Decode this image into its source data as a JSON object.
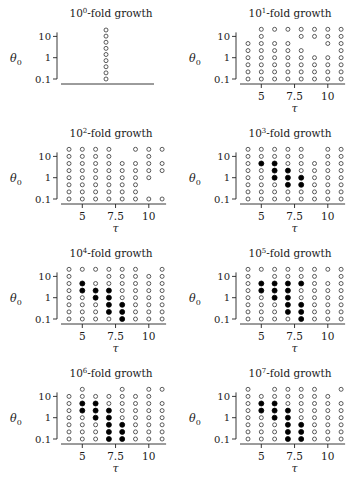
{
  "figure": {
    "y_label": "θ0",
    "x_label": "τ",
    "y_ticks": [
      "10",
      "1",
      "0.1"
    ],
    "x_ticks": [
      "5",
      "7.5",
      "10"
    ],
    "legend": {
      "open": "open circle",
      "filled": "filled circle"
    }
  },
  "chart_data": [
    {
      "type": "scatter",
      "title": "10^0-fold growth",
      "title_base": "10",
      "title_exp": "0",
      "title_suffix": "-fold growth",
      "xlabel": "",
      "ylabel": "θ0",
      "yticks": [
        10,
        1,
        0.1
      ],
      "xticks": [],
      "single_column": true,
      "points": "9 open circles in a single vertical column spanning θ0 0.1 to ~30"
    },
    {
      "type": "scatter",
      "title": "10^1-fold growth",
      "title_base": "10",
      "title_exp": "1",
      "title_suffix": "-fold growth",
      "xlabel": "τ",
      "ylabel": "θ0",
      "tau": [
        4,
        5,
        6,
        7,
        8,
        9,
        10,
        11
      ],
      "theta0": [
        21.5,
        10,
        4.64,
        2.15,
        1,
        0.464,
        0.215,
        0.1
      ],
      "xticks": [
        5,
        7.5,
        10
      ],
      "yticks": [
        10,
        1,
        0.1
      ],
      "grid": [
        ".ooooooo",
        ".o..oooo",
        "oooo..oo",
        "ooooo..o",
        "oooooooo",
        "oooooooo",
        "oooooooo",
        "oooooooo"
      ]
    },
    {
      "type": "scatter",
      "title": "10^2-fold growth",
      "title_base": "10",
      "title_exp": "2",
      "title_suffix": "-fold growth",
      "xlabel": "τ",
      "ylabel": "θ0",
      "tau": [
        4,
        5,
        6,
        7,
        8,
        9,
        10,
        11
      ],
      "theta0": [
        21.5,
        10,
        4.64,
        2.15,
        1,
        0.464,
        0.215,
        0.1
      ],
      "xticks": [
        5,
        7.5,
        10
      ],
      "yticks": [
        10,
        1,
        0.1
      ],
      "grid": [
        "oooo.ooo",
        "oooo..o.",
        "oooooooo",
        "oooooooo",
        "ooooooo.",
        "oooooo..",
        "oooooo..",
        "oooooooo"
      ]
    },
    {
      "type": "scatter",
      "title": "10^3-fold growth",
      "title_base": "10",
      "title_exp": "3",
      "title_suffix": "-fold growth",
      "xlabel": "τ",
      "ylabel": "θ0",
      "tau": [
        4,
        5,
        6,
        7,
        8,
        9,
        10,
        11
      ],
      "theta0": [
        21.5,
        10,
        4.64,
        2.15,
        1,
        0.464,
        0.215,
        0.1
      ],
      "xticks": [
        5,
        7.5,
        10
      ],
      "yticks": [
        10,
        1,
        0.1
      ],
      "grid": [
        "ooooo.oo",
        "ooooo.oo",
        "o##ooooo",
        "oo##oooo",
        "oo###ooo",
        "ooo##ooo",
        "oooooooo",
        "oooooooo"
      ]
    },
    {
      "type": "scatter",
      "title": "10^4-fold growth",
      "title_base": "10",
      "title_exp": "4",
      "title_suffix": "-fold growth",
      "xlabel": "τ",
      "ylabel": "θ0",
      "tau": [
        4,
        5,
        6,
        7,
        8,
        9,
        10,
        11
      ],
      "theta0": [
        21.5,
        10,
        4.64,
        2.15,
        1,
        0.464,
        0.215,
        0.1
      ],
      "xticks": [
        5,
        7.5,
        10
      ],
      "yticks": [
        10,
        1,
        0.1
      ],
      "grid": [
        "oooooo.o",
        "o..ooooo",
        "o#oooooo",
        "o###oooo",
        "oo##oooo",
        "ooo##ooo",
        "ooo##ooo",
        "oooo#ooo"
      ]
    },
    {
      "type": "scatter",
      "title": "10^5-fold growth",
      "title_base": "10",
      "title_exp": "5",
      "title_suffix": "-fold growth",
      "xlabel": "τ",
      "ylabel": "θ0",
      "tau": [
        4,
        5,
        6,
        7,
        8,
        9,
        10,
        11
      ],
      "theta0": [
        21.5,
        10,
        4.64,
        2.15,
        1,
        0.464,
        0.215,
        0.1
      ],
      "xticks": [
        5,
        7.5,
        10
      ],
      "yticks": [
        10,
        1,
        0.1
      ],
      "grid": [
        "oooooooo",
        "o.oooo.o",
        "o####ooo",
        "o###oooo",
        "oo##oooo",
        "ooo##ooo",
        "ooo##ooo",
        "oooo#ooo"
      ]
    },
    {
      "type": "scatter",
      "title": "10^6-fold growth",
      "title_base": "10",
      "title_exp": "6",
      "title_suffix": "-fold growth",
      "xlabel": "τ",
      "ylabel": "θ0",
      "tau": [
        4,
        5,
        6,
        7,
        8,
        9,
        10,
        11
      ],
      "theta0": [
        21.5,
        10,
        4.64,
        2.15,
        1,
        0.464,
        0.215,
        0.1
      ],
      "xticks": [
        5,
        7.5,
        10
      ],
      "yticks": [
        10,
        1,
        0.1
      ],
      "grid": [
        ".o..o.oo",
        "ooooooo.",
        "o##ooooo",
        "o###oooo",
        "oo##oooo",
        "ooo##ooo",
        "ooo##ooo",
        "ooo##ooo"
      ]
    },
    {
      "type": "scatter",
      "title": "10^7-fold growth",
      "title_base": "10",
      "title_exp": "7",
      "title_suffix": "-fold growth",
      "xlabel": "τ",
      "ylabel": "θ0",
      "tau": [
        4,
        5,
        6,
        7,
        8,
        9,
        10,
        11
      ],
      "theta0": [
        21.5,
        10,
        4.64,
        2.15,
        1,
        0.464,
        0.215,
        0.1
      ],
      "xticks": [
        5,
        7.5,
        10
      ],
      "yticks": [
        10,
        1,
        0.1
      ],
      "grid": [
        "o.oooo.o",
        "ooooooo.",
        "o##ooooo",
        "o###oooo",
        "oo##oooo",
        "ooo##ooo",
        "ooo##ooo",
        "ooo##ooo"
      ]
    }
  ]
}
